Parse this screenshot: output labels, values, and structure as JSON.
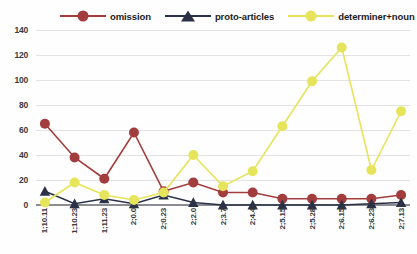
{
  "chart_data": {
    "type": "line",
    "title": "",
    "xlabel": "",
    "ylabel": "",
    "ylim": [
      0,
      140
    ],
    "ytick_step": 20,
    "grid": true,
    "legend_position": "top",
    "categories": [
      "1;10.11",
      "1;10.23",
      "1;11.23",
      "2;0.0",
      "2;0.23",
      "2;2.0",
      "2;3.7",
      "2;4.4",
      "2;5.15",
      "2;5.28",
      "2;6.15",
      "2;6.23",
      "2;7.13"
    ],
    "yticks": [
      "0",
      "20",
      "40",
      "60",
      "80",
      "100",
      "120",
      "140"
    ],
    "series": [
      {
        "name": "omission",
        "color": "#a33c3c",
        "marker": "circle",
        "values": [
          65,
          38,
          21,
          58,
          11,
          18,
          10,
          10,
          5,
          5,
          5,
          5,
          8
        ]
      },
      {
        "name": "proto-articles",
        "color": "#2b3246",
        "marker": "triangle",
        "values": [
          11,
          1,
          5,
          1,
          8,
          2,
          0,
          0,
          0,
          0,
          0,
          1,
          2
        ]
      },
      {
        "name": "determiner+noun",
        "color": "#e6e45a",
        "marker": "circle",
        "values": [
          2,
          18,
          8,
          4,
          10,
          40,
          15,
          27,
          63,
          99,
          126,
          28,
          75
        ]
      }
    ]
  },
  "colors": {
    "omission": "#a33c3c",
    "proto_articles": "#2b3246",
    "determiner_noun": "#e6e45a",
    "grid": "#e3e3e6",
    "axis": "#8c8c93",
    "text": "#3a3a3a",
    "background": "#fefefe"
  }
}
